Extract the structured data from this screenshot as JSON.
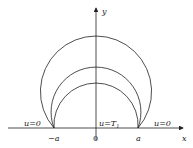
{
  "diagram": {
    "axes": {
      "x_label": "x",
      "y_label": "y"
    },
    "ticks": {
      "neg_a": "−a",
      "origin": "0",
      "pos_a": "a"
    },
    "boundary_labels": {
      "left": "u=0",
      "center": "u=T",
      "center_sub": "1",
      "right": "u=0"
    },
    "arcs": [
      {
        "name": "outer",
        "peak_ratio": 2.19
      },
      {
        "name": "middle",
        "peak_ratio": 1.45
      },
      {
        "name": "inner",
        "peak_ratio": 1.07
      }
    ]
  }
}
